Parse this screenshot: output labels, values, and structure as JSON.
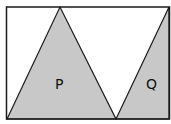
{
  "diagram": {
    "shapes": [
      {
        "id": "P",
        "label": "P"
      },
      {
        "id": "Q",
        "label": "Q"
      }
    ],
    "colors": {
      "fill": "#c8c8c8",
      "stroke": "#1a1a1a",
      "background": "#ffffff"
    }
  }
}
